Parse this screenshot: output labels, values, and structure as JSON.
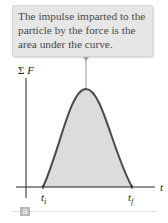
{
  "callout": {
    "text": "The impulse imparted to the particle by the force is the area under the curve."
  },
  "axes": {
    "y_label_symbol": "Σ",
    "y_label_var": "F",
    "x_label": "t",
    "t_initial": "t",
    "t_initial_sub": "i",
    "t_final": "t",
    "t_final_sub": "f"
  },
  "panel_label": "a",
  "colors": {
    "curve": "#4a4a4a",
    "fill": "#dcdcdc",
    "callout_bg": "#e6e6e6",
    "axis": "#222222"
  }
}
